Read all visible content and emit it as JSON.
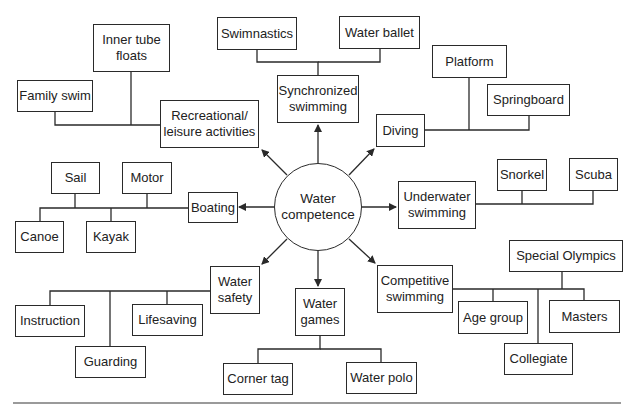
{
  "diagram": {
    "title": "",
    "center": {
      "label": "Water\ncompetence"
    },
    "categories": [
      {
        "id": "recreational",
        "label": "Recreational/\nleisure activities",
        "children": [
          "Family swim",
          "Inner tube floats"
        ]
      },
      {
        "id": "synchronized",
        "label": "Synchronized\nswimming",
        "children": [
          "Swimnastics",
          "Water ballet"
        ]
      },
      {
        "id": "diving",
        "label": "Diving",
        "children": [
          "Platform",
          "Springboard"
        ]
      },
      {
        "id": "underwater",
        "label": "Underwater\nswimming",
        "children": [
          "Snorkel",
          "Scuba"
        ]
      },
      {
        "id": "competitive",
        "label": "Competitive\nswimming",
        "children": [
          "Age group",
          "Collegiate",
          "Special Olympics",
          "Masters"
        ]
      },
      {
        "id": "games",
        "label": "Water\ngames",
        "children": [
          "Corner tag",
          "Water polo"
        ]
      },
      {
        "id": "safety",
        "label": "Water\nsafety",
        "children": [
          "Instruction",
          "Guarding",
          "Lifesaving"
        ]
      },
      {
        "id": "boating",
        "label": "Boating",
        "children": [
          "Sail",
          "Motor",
          "Canoe",
          "Kayak"
        ]
      }
    ],
    "nodes": {
      "swimnastics": "Swimnastics",
      "water_ballet": "Water ballet",
      "inner_tube": "Inner tube\nfloats",
      "family_swim": "Family swim",
      "recreational": "Recreational/\nleisure activities",
      "synchronized": "Synchronized\nswimming",
      "platform": "Platform",
      "springboard": "Springboard",
      "diving": "Diving",
      "snorkel": "Snorkel",
      "scuba": "Scuba",
      "underwater": "Underwater\nswimming",
      "sail": "Sail",
      "motor": "Motor",
      "boating": "Boating",
      "canoe": "Canoe",
      "kayak": "Kayak",
      "water_safety": "Water\nsafety",
      "instruction": "Instruction",
      "lifesaving": "Lifesaving",
      "guarding": "Guarding",
      "water_games": "Water\ngames",
      "corner_tag": "Corner tag",
      "water_polo": "Water polo",
      "competitive": "Competitive\nswimming",
      "special_olympics": "Special Olympics",
      "age_group": "Age group",
      "masters": "Masters",
      "collegiate": "Collegiate",
      "center": "Water\ncompetence"
    },
    "colors": {
      "stroke": "#2a2a2a",
      "background": "#ffffff",
      "text": "#222222",
      "rule": "#9a9a9a"
    }
  }
}
